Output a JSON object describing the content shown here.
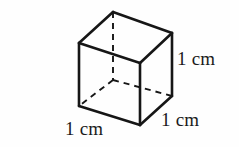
{
  "figure": {
    "name": "unit-cube-diagram",
    "background_color": "#fefefe",
    "stroke_color": "#161616",
    "solid_stroke_width": 2.6,
    "dashed_stroke_width": 1.9,
    "dash_pattern": "6,5"
  },
  "labels": {
    "height": "1 cm",
    "width": "1 cm",
    "depth": "1 cm"
  },
  "geometry": {
    "vertices": {
      "top_back_left": {
        "x": 79,
        "y": 43
      },
      "top_back_right": {
        "x": 113,
        "y": 12
      },
      "top_front_right": {
        "x": 172,
        "y": 33
      },
      "top_front_left": {
        "x": 140,
        "y": 63
      },
      "bottom_back_left": {
        "x": 79,
        "y": 106
      },
      "bottom_hidden": {
        "x": 113,
        "y": 80
      },
      "bottom_front_right": {
        "x": 172,
        "y": 96
      },
      "bottom_front_left": {
        "x": 140,
        "y": 125
      }
    },
    "solid_edges": [
      "top_back_left-top_back_right",
      "top_back_right-top_front_right",
      "top_front_right-top_front_left",
      "top_front_left-top_back_left",
      "top_back_left-bottom_back_left",
      "top_front_left-bottom_front_left",
      "top_front_right-bottom_front_right",
      "bottom_back_left-bottom_front_left",
      "bottom_front_left-bottom_front_right"
    ],
    "dashed_edges": [
      "top_back_right-bottom_hidden",
      "bottom_hidden-bottom_back_left",
      "bottom_hidden-bottom_front_right"
    ]
  }
}
